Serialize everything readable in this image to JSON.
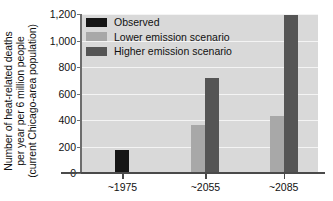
{
  "chart_data": {
    "type": "bar",
    "title": "",
    "xlabel": "",
    "ylabel": "Number of heat-related deaths per year per 6 million people (current Chicago-area population)",
    "ylabel_lines": [
      "Number of heat-related deaths",
      "per year per 6 million people",
      "(current Chicago-area population)"
    ],
    "categories": [
      "~1975",
      "~2055",
      "~2085"
    ],
    "series": [
      {
        "name": "Observed",
        "color": "#161616",
        "values": [
          170,
          null,
          null
        ]
      },
      {
        "name": "Lower emission scenario",
        "color": "#a8a8a8",
        "values": [
          null,
          365,
          430
        ]
      },
      {
        "name": "Higher emission scenario",
        "color": "#555555",
        "values": [
          null,
          720,
          1195
        ]
      }
    ],
    "ylim": [
      0,
      1200
    ],
    "yticks": [
      0,
      200,
      400,
      600,
      800,
      1000,
      1200
    ],
    "ytick_labels": [
      "0",
      "200",
      "400",
      "600",
      "800",
      "1,000",
      "1,200"
    ],
    "grid": true,
    "legend_position": "top-left",
    "plot_background": "#d9d9d9",
    "gridline_color": "#f4f4f4"
  },
  "legend": {
    "items": [
      {
        "label": "Observed",
        "color": "#161616"
      },
      {
        "label": "Lower emission scenario",
        "color": "#a8a8a8"
      },
      {
        "label": "Higher emission scenario",
        "color": "#555555"
      }
    ]
  }
}
